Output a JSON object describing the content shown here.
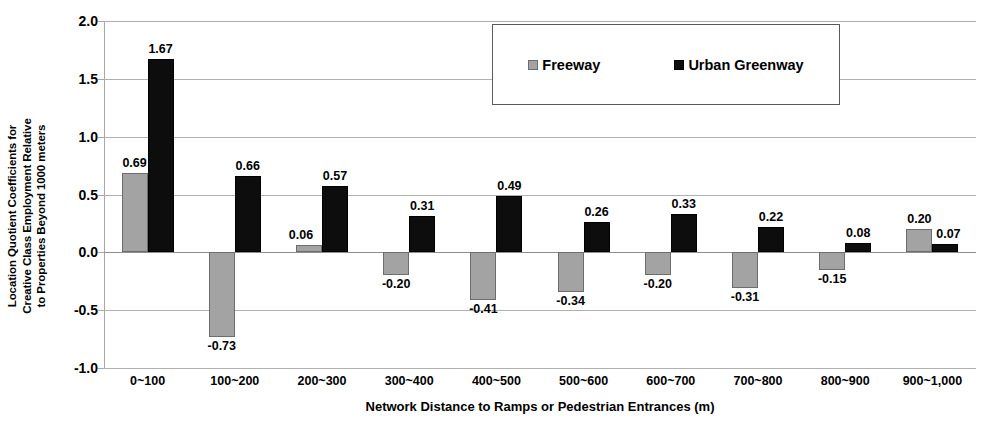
{
  "chart_data": {
    "type": "bar",
    "title": "",
    "xlabel": "Network Distance to Ramps or Pedestrian Entrances (m)",
    "ylabel": "Location Quotient Coefficients for\nCreative Class Employment Relative\nto Properties Beyond 1000 meters",
    "categories": [
      "0~100",
      "100~200",
      "200~300",
      "300~400",
      "400~500",
      "500~600",
      "600~700",
      "700~800",
      "800~900",
      "900~1,000"
    ],
    "series": [
      {
        "name": "Freeway",
        "color": "#a3a3a3",
        "values": [
          0.69,
          -0.73,
          0.06,
          -0.2,
          -0.41,
          -0.34,
          -0.2,
          -0.31,
          -0.15,
          0.2
        ],
        "labels": [
          "0.69",
          "-0.73",
          "0.06",
          "-0.20",
          "-0.41",
          "-0.34",
          "-0.20",
          "-0.31",
          "-0.15",
          "0.20"
        ]
      },
      {
        "name": "Urban Greenway",
        "color": "#0d0d0d",
        "values": [
          1.67,
          0.66,
          0.57,
          0.31,
          0.49,
          0.26,
          0.33,
          0.22,
          0.08,
          0.07
        ],
        "labels": [
          "1.67",
          "0.66",
          "0.57",
          "0.31",
          "0.49",
          "0.26",
          "0.33",
          "0.22",
          "0.08",
          "0.07"
        ]
      }
    ],
    "ylim": [
      -1.0,
      2.0
    ],
    "yticks": [
      2.0,
      1.5,
      1.0,
      0.5,
      0.0,
      -0.5,
      -1.0
    ],
    "ytick_labels": [
      "2.0",
      "1.5",
      "1.0",
      "0.5",
      "0.0",
      "-0.5",
      "-1.0"
    ],
    "grid": true,
    "legend_position": "top-center-inside",
    "legend_entries": [
      "Freeway",
      "Urban Greenway"
    ]
  }
}
